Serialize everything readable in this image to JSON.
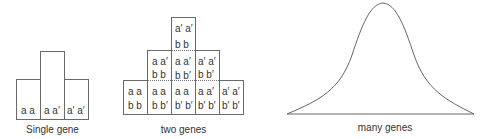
{
  "panels": {
    "single": {
      "label": "Single gene",
      "bars": [
        {
          "genotype": "a a",
          "height_units": 1
        },
        {
          "genotype": "a a′",
          "height_units": 2
        },
        {
          "genotype": "a′ a′",
          "height_units": 1
        }
      ]
    },
    "two": {
      "label": "two genes",
      "columns": [
        {
          "cells": [
            {
              "a": "a a",
              "b": "b b"
            }
          ]
        },
        {
          "cells": [
            {
              "a": "a a",
              "b": "b b′"
            },
            {
              "a": "a a′",
              "b": "b b"
            }
          ]
        },
        {
          "cells": [
            {
              "a": "a a",
              "b": "b′ b′"
            },
            {
              "a": "a a′",
              "b": "b b′"
            },
            {
              "a": "a′ a′",
              "b": "b b"
            }
          ]
        },
        {
          "cells": [
            {
              "a": "a a′",
              "b": "b′ b′"
            },
            {
              "a": "a′ a′",
              "b": "b b′"
            }
          ]
        },
        {
          "cells": [
            {
              "a": "a′ a′",
              "b": "b′ b′"
            }
          ]
        }
      ]
    },
    "many": {
      "label": "many genes",
      "curve": "normal-distribution"
    }
  }
}
